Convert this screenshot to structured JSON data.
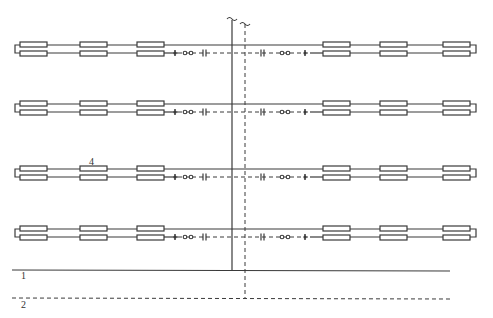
{
  "diagram": {
    "type": "schematic",
    "colors": {
      "line": "#3a3a3a",
      "background": "#ffffff"
    },
    "rows": [
      {
        "y": 49,
        "index": 1
      },
      {
        "y": 108,
        "index": 2
      },
      {
        "y": 173,
        "index": 3
      },
      {
        "y": 233,
        "index": 4
      }
    ],
    "left_boxes_x": [
      20,
      80,
      137
    ],
    "right_boxes_x": [
      323,
      380,
      443
    ],
    "box_width": 27,
    "symbols_left": [
      "ground-symbol",
      "coupling-symbol",
      "capacitor-symbol"
    ],
    "symbols_right": [
      "capacitor-symbol",
      "coupling-symbol",
      "ground-symbol"
    ],
    "vertical_solid_x": 232,
    "vertical_dashed_x": 245,
    "labels": {
      "line1": "1",
      "line2": "2",
      "component4": "4"
    }
  }
}
